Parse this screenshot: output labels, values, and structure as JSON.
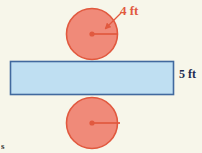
{
  "figure": {
    "background_color": "#f7f6ea",
    "labels": {
      "circle_measure": "4 ft",
      "rectangle_measure": "5 ft",
      "corner_mark": "s"
    },
    "colors": {
      "circle_fill": "#f08a79",
      "circle_stroke": "#e1593f",
      "radius_line": "#e1593f",
      "rectangle_fill": "#bfdff2",
      "rectangle_stroke": "#41699e",
      "label_red": "#e1593f",
      "label_navy": "#1b2b50"
    },
    "shapes": {
      "top_circle": {
        "name": "top-circle",
        "cx": 92,
        "cy": 34,
        "r": 26
      },
      "bottom_circle": {
        "name": "bottom-circle",
        "cx": 92,
        "cy": 123,
        "r": 26
      },
      "rectangle": {
        "name": "lateral-rectangle",
        "x": 10,
        "y": 61,
        "width": 164,
        "height": 34
      },
      "top_radius_line": {
        "x1": 92,
        "y1": 34,
        "x2": 118,
        "y2": 34
      },
      "bottom_radius_line": {
        "x1": 92,
        "y1": 123,
        "x2": 120,
        "y2": 123
      },
      "leader_arrow": {
        "x1": 121,
        "y1": 13,
        "x2": 104,
        "y2": 30
      }
    }
  }
}
